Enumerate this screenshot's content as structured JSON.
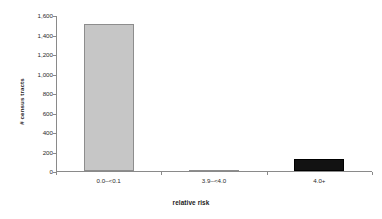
{
  "chart_data": {
    "type": "bar",
    "title": "",
    "subtitle": "",
    "xlabel": "relative risk",
    "ylabel": "# census tracts",
    "categories": [
      "0.0–<0.1",
      "3.9–<4.0",
      "4.0+"
    ],
    "values": [
      1510,
      4,
      123
    ],
    "series": [
      {
        "name": "# census tracts",
        "values": [
          1510,
          4,
          123
        ]
      }
    ],
    "bar_colors": [
      "#c6c6c6",
      "#8d8d8d",
      "#121212"
    ],
    "ylim": [
      0,
      1600
    ],
    "ytick_values": [
      0,
      200,
      400,
      600,
      800,
      1000,
      1200,
      1400,
      1600
    ],
    "ytick_labels": [
      "0",
      "200",
      "400",
      "600",
      "800",
      "1,000",
      "1,200",
      "1,400",
      "1,600"
    ],
    "grid": false,
    "legend": false,
    "legend_position": "none",
    "axis_color": "#8a8a8a",
    "text_color": "#2b2b2b",
    "background": "#ffffff"
  }
}
